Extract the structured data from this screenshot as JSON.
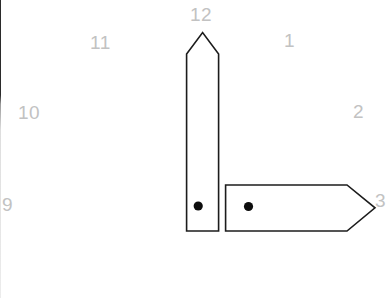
{
  "scene": {
    "title": "Analog clock face",
    "background_color": "#ffffff",
    "border_color": "#2b2b2b"
  },
  "clock": {
    "numeral_color": "#c2c2c2",
    "hand_outline_color": "#1c1c1c",
    "hand_fill_color": "#ffffff",
    "pivot_dot_color": "#0d0d0d",
    "numerals": [
      {
        "id": "num-12",
        "label": "12"
      },
      {
        "id": "num-1",
        "label": "1"
      },
      {
        "id": "num-2",
        "label": "2"
      },
      {
        "id": "num-3",
        "label": "3"
      },
      {
        "id": "num-9",
        "label": "9"
      },
      {
        "id": "num-10",
        "label": "10"
      },
      {
        "id": "num-11",
        "label": "11"
      }
    ],
    "hands": [
      {
        "id": "hand-hour-12",
        "name": "hour-hand",
        "points_to": "12",
        "direction": "up",
        "tip_shape": "pointed-pentagon",
        "has_pivot_dot": true
      },
      {
        "id": "hand-minute-3",
        "name": "minute-hand",
        "points_to": "3",
        "direction": "right",
        "tip_shape": "arrow-chevron",
        "has_pivot_dot": true
      }
    ],
    "reading": {
      "hour": "12",
      "minute": "3"
    }
  }
}
